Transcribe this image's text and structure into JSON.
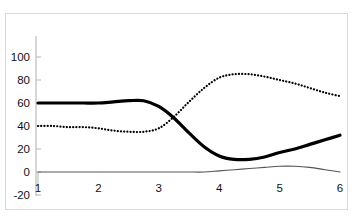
{
  "chart_data": {
    "type": "line",
    "title": "",
    "xlabel": "",
    "ylabel": "",
    "xlim": [
      1,
      6
    ],
    "ylim": [
      -20,
      100
    ],
    "grid": false,
    "legend": "none",
    "x_ticks": [
      "1",
      "2",
      "3",
      "4",
      "5",
      "6"
    ],
    "y_ticks": [
      "100",
      "80",
      "60",
      "40",
      "20",
      "0",
      "-20"
    ],
    "x": [
      1,
      1.25,
      1.5,
      1.75,
      2,
      2.25,
      2.5,
      2.75,
      3,
      3.25,
      3.5,
      3.75,
      4,
      4.25,
      4.5,
      4.75,
      5,
      5.25,
      5.5,
      5.75,
      6
    ],
    "series": [
      {
        "name": "thick-solid-series",
        "style": "solid",
        "color": "#000000",
        "width": 3.2,
        "values": [
          60,
          60,
          60,
          60,
          60,
          61,
          62,
          62,
          57,
          47,
          34,
          22,
          14,
          11,
          11,
          13,
          17,
          20,
          24,
          28,
          32
        ]
      },
      {
        "name": "dotted-series",
        "style": "dotted",
        "color": "#000000",
        "width": 2.2,
        "values": [
          40,
          40,
          39,
          39,
          38,
          36,
          35,
          35,
          38,
          48,
          61,
          73,
          82,
          85,
          85,
          83,
          80,
          77,
          73,
          69,
          66
        ]
      },
      {
        "name": "thin-flat-series",
        "style": "solid",
        "color": "#555555",
        "width": 1.1,
        "values": [
          0,
          0,
          0,
          0,
          0,
          0,
          0,
          0,
          0,
          0,
          0,
          0,
          1,
          2,
          3,
          4,
          5,
          5,
          4,
          2,
          0
        ]
      }
    ]
  }
}
